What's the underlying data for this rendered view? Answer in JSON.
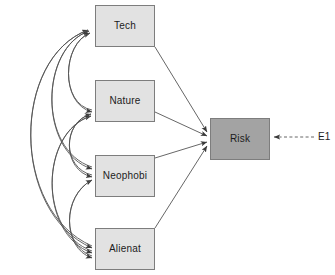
{
  "diagram": {
    "type": "structural-equation-model-path-diagram",
    "canvas": {
      "width": 335,
      "height": 275
    },
    "colors": {
      "exogenous_fill": "#e2e2e2",
      "endogenous_fill": "#a3a3a3",
      "box_stroke": "#7d7d7d",
      "path_stroke": "#555555",
      "background": "#ffffff",
      "text": "#1c1c1c"
    },
    "nodes": [
      {
        "id": "tech",
        "label": "Tech",
        "role": "exogenous",
        "x": 95,
        "y": 5,
        "w": 60,
        "h": 42
      },
      {
        "id": "nature",
        "label": "Nature",
        "role": "exogenous",
        "x": 95,
        "y": 80,
        "w": 60,
        "h": 42
      },
      {
        "id": "neophobi",
        "label": "Neophobi",
        "role": "exogenous",
        "x": 95,
        "y": 155,
        "w": 60,
        "h": 42
      },
      {
        "id": "alienat",
        "label": "Alienat",
        "role": "exogenous",
        "x": 95,
        "y": 228,
        "w": 60,
        "h": 42
      },
      {
        "id": "risk",
        "label": "Risk",
        "role": "endogenous",
        "x": 210,
        "y": 118,
        "w": 60,
        "h": 42
      }
    ],
    "error_terms": [
      {
        "id": "e1",
        "label": "E1",
        "x": 318,
        "y": 132,
        "target": "risk",
        "style": "dashed"
      }
    ],
    "regression_paths": [
      {
        "from": "tech",
        "to": "risk"
      },
      {
        "from": "nature",
        "to": "risk"
      },
      {
        "from": "neophobi",
        "to": "risk"
      },
      {
        "from": "alienat",
        "to": "risk"
      }
    ],
    "covariance_paths": [
      {
        "between": [
          "tech",
          "nature"
        ]
      },
      {
        "between": [
          "tech",
          "neophobi"
        ]
      },
      {
        "between": [
          "tech",
          "alienat"
        ]
      },
      {
        "between": [
          "nature",
          "neophobi"
        ]
      },
      {
        "between": [
          "nature",
          "alienat"
        ]
      },
      {
        "between": [
          "neophobi",
          "alienat"
        ]
      }
    ]
  }
}
